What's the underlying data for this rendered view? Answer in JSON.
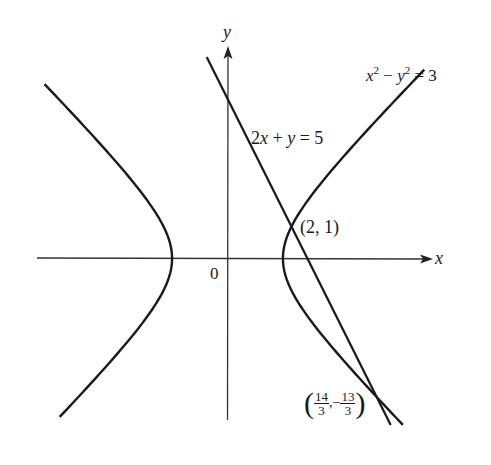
{
  "chart_data": {
    "type": "line",
    "title": "",
    "xlabel": "x",
    "ylabel": "y",
    "origin_label": "0",
    "grid": false,
    "legend": null,
    "series": [
      {
        "name": "hyperbola",
        "equation": "x^2 - y^2 = 3",
        "kind": "hyperbola",
        "branches": [
          "left",
          "right"
        ],
        "vertices": [
          [
            -1.732,
            0
          ],
          [
            1.732,
            0
          ]
        ],
        "y_range": [
          -5.2,
          5.9
        ]
      },
      {
        "name": "line",
        "equation": "2x + y = 5",
        "kind": "line",
        "slope": -2,
        "intercept": 5,
        "x_range": [
          -0.65,
          5.1
        ]
      }
    ],
    "points": [
      {
        "label": "(2, 1)",
        "x": 2,
        "y": 1
      },
      {
        "label": "(14/3, -13/3)",
        "x": 4.6667,
        "y": -4.3333
      }
    ],
    "annotations": [
      {
        "text": "x^2 - y^2 = 3",
        "target": "hyperbola"
      },
      {
        "text": "2x + y = 5",
        "target": "line"
      },
      {
        "text": "(2, 1)",
        "target": "intersection-1"
      },
      {
        "text": "(14/3, -13/3)",
        "target": "intersection-2"
      }
    ],
    "axis_ranges": {
      "x": [
        -5.9,
        6.5
      ],
      "y": [
        -5.1,
        6.6
      ]
    }
  },
  "labels": {
    "x_axis": "x",
    "y_axis": "y",
    "origin": "0",
    "hyperbola_eq": {
      "a": "x",
      "sup1": "2",
      "minus": " − ",
      "b": "y",
      "sup2": "2",
      "rest": " = 3"
    },
    "line_eq": {
      "a": "2",
      "x": "x",
      "plus": " + ",
      "y": "y",
      "rest": " = 5"
    },
    "point1": "(2, 1)",
    "point2": {
      "num1": "14",
      "den1": "3",
      "sep": ",−",
      "num2": "13",
      "den2": "3"
    }
  },
  "style": {
    "stroke": "#1a1a1a",
    "axis_stroke": "#333333"
  }
}
